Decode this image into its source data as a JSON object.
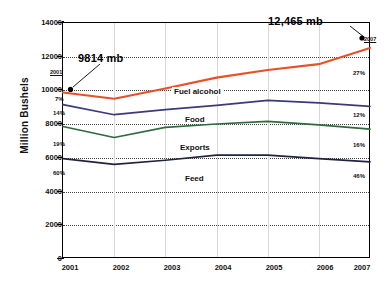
{
  "chart_data": {
    "type": "line",
    "title": "",
    "xlabel": "",
    "ylabel": "Million Bushels",
    "categories": [
      "2001",
      "2002",
      "2003",
      "2004",
      "2005",
      "2006",
      "2007"
    ],
    "ylim": [
      0,
      14000
    ],
    "ytick_values": [
      0,
      2000,
      4000,
      6000,
      8000,
      10000,
      12000,
      14000
    ],
    "ytick_labels": [
      "0",
      "2000",
      "4000",
      "6000",
      "8000",
      "10000",
      "12000",
      "14000"
    ],
    "grid": true,
    "legend_position": "inline-on-lines",
    "series": [
      {
        "name": "Fuel alcohol",
        "color": "#E8502A",
        "values": [
          9814,
          9450,
          10050,
          10700,
          11150,
          11500,
          12465
        ],
        "start_pct": "7%",
        "end_pct": "27%"
      },
      {
        "name": "Food",
        "color": "#3B3B7A",
        "values": [
          9100,
          8500,
          8800,
          9050,
          9350,
          9200,
          9000
        ],
        "start_pct": "14%",
        "end_pct": "12%"
      },
      {
        "name": "Exports",
        "color": "#2E6B3E",
        "values": [
          7800,
          7150,
          7750,
          7950,
          8100,
          7900,
          7650
        ],
        "start_pct": "19%",
        "end_pct": "16%"
      },
      {
        "name": "Feed",
        "color": "#1F2440",
        "values": [
          5900,
          5550,
          5800,
          6100,
          6100,
          5900,
          5700
        ],
        "start_pct": "60%",
        "end_pct": "46%"
      }
    ],
    "annotations": [
      {
        "id": "start-callout",
        "text": "9814 mb",
        "year_label": "2001",
        "points_to_category": "2001",
        "points_to_series": "Fuel alcohol"
      },
      {
        "id": "end-callout",
        "text": "12,465 mb",
        "year_label": "2007",
        "points_to_category": "2007",
        "points_to_series": "Fuel alcohol"
      }
    ]
  }
}
